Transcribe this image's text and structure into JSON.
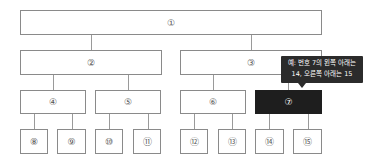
{
  "diagram": {
    "type": "binary-tree",
    "nodes": [
      {
        "id": 1,
        "label": "①"
      },
      {
        "id": 2,
        "label": "②"
      },
      {
        "id": 3,
        "label": "③"
      },
      {
        "id": 4,
        "label": "④"
      },
      {
        "id": 5,
        "label": "⑤"
      },
      {
        "id": 6,
        "label": "⑥"
      },
      {
        "id": 7,
        "label": "⑦",
        "highlighted": true
      },
      {
        "id": 8,
        "label": "⑧"
      },
      {
        "id": 9,
        "label": "⑨"
      },
      {
        "id": 10,
        "label": "⑩"
      },
      {
        "id": 11,
        "label": "⑪"
      },
      {
        "id": 12,
        "label": "⑫"
      },
      {
        "id": 13,
        "label": "⑬"
      },
      {
        "id": 14,
        "label": "⑭"
      },
      {
        "id": 15,
        "label": "⑮"
      }
    ],
    "edges": [
      [
        1,
        2
      ],
      [
        1,
        3
      ],
      [
        2,
        4
      ],
      [
        2,
        5
      ],
      [
        3,
        6
      ],
      [
        3,
        7
      ],
      [
        4,
        8
      ],
      [
        4,
        9
      ],
      [
        5,
        10
      ],
      [
        5,
        11
      ],
      [
        6,
        12
      ],
      [
        6,
        13
      ],
      [
        7,
        14
      ],
      [
        7,
        15
      ]
    ],
    "tooltip": {
      "line1": "예: 번호 7의 왼쪽 아래는",
      "line2": "14, 오른쪽 아래는 15"
    },
    "colors": {
      "highlight": "#1e1e1e",
      "border": "#8a8a8a",
      "tooltip_bg": "#2b2b2b"
    }
  }
}
